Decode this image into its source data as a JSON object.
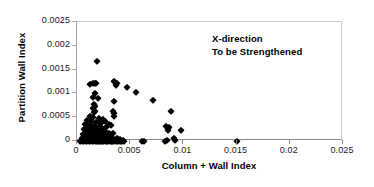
{
  "chart_data": {
    "type": "scatter",
    "title": "",
    "xlabel": "Column + Wall Index",
    "ylabel": "Partition Wall Index",
    "xlim": [
      0,
      0.025
    ],
    "ylim": [
      0,
      0.0025
    ],
    "xticks": [
      "0",
      "0.005",
      "0.01",
      "0.015",
      "0.02",
      "0.025"
    ],
    "xtick_values": [
      0,
      0.005,
      0.01,
      0.015,
      0.02,
      0.025
    ],
    "yticks": [
      "0",
      "0.0005",
      "0.001",
      "0.0015",
      "0.002",
      "0.0025"
    ],
    "ytick_values": [
      0,
      0.0005,
      0.001,
      0.0015,
      0.002,
      0.0025
    ],
    "grid": false,
    "legend": null,
    "marker": "diamond",
    "marker_color": "#000000",
    "annotations": [
      {
        "text": "X-direction",
        "x": 0.0145,
        "y": 0.00225
      },
      {
        "text": "To be Strengthened",
        "x": 0.0145,
        "y": 0.00212
      }
    ],
    "series": [
      {
        "name": "Buildings",
        "points": [
          [
            0.00185,
            0.00168
          ],
          [
            0.00125,
            0.00119
          ],
          [
            0.00155,
            0.00122
          ],
          [
            0.00168,
            0.00122
          ],
          [
            0.0018,
            0.00122
          ],
          [
            0.00345,
            0.00127
          ],
          [
            0.00358,
            0.00124
          ],
          [
            0.00368,
            0.00118
          ],
          [
            0.00375,
            0.00121
          ],
          [
            0.0047,
            0.00113
          ],
          [
            0.00555,
            0.00102
          ],
          [
            0.00168,
            0.001
          ],
          [
            0.00152,
            0.00093
          ],
          [
            0.00195,
            0.00091
          ],
          [
            0.0035,
            0.00084
          ],
          [
            0.00718,
            0.00086
          ],
          [
            0.00158,
            0.00077
          ],
          [
            0.00165,
            0.00073
          ],
          [
            0.0015,
            0.00069
          ],
          [
            0.00172,
            0.00064
          ],
          [
            0.0016,
            0.0006
          ],
          [
            0.0034,
            0.00063
          ],
          [
            0.00352,
            0.00058
          ],
          [
            0.00345,
            0.00052
          ],
          [
            0.00882,
            0.00062
          ],
          [
            0.0012,
            0.00052
          ],
          [
            0.00148,
            0.0005
          ],
          [
            0.0021,
            0.00048
          ],
          [
            0.00245,
            0.00046
          ],
          [
            0.00262,
            0.00041
          ],
          [
            0.00098,
            0.00044
          ],
          [
            0.00135,
            0.00042
          ],
          [
            0.00178,
            0.0004
          ],
          [
            0.00205,
            0.00039
          ],
          [
            0.00228,
            0.00037
          ],
          [
            0.00302,
            0.00035
          ],
          [
            0.00318,
            0.00033
          ],
          [
            0.00075,
            0.00036
          ],
          [
            0.00092,
            0.00034
          ],
          [
            0.00112,
            0.00033
          ],
          [
            0.0013,
            0.00032
          ],
          [
            0.00148,
            0.00031
          ],
          [
            0.00162,
            0.0003
          ],
          [
            0.0018,
            0.00029
          ],
          [
            0.00198,
            0.00028
          ],
          [
            0.00215,
            0.0003
          ],
          [
            0.00232,
            0.00027
          ],
          [
            0.00255,
            0.00026
          ],
          [
            0.00272,
            0.00029
          ],
          [
            0.0084,
            0.00032
          ],
          [
            0.00852,
            0.00028
          ],
          [
            0.00862,
            0.0003
          ],
          [
            0.00858,
            0.00024
          ],
          [
            0.0098,
            0.00024
          ],
          [
            0.00068,
            0.00025
          ],
          [
            0.00082,
            0.00024
          ],
          [
            0.00098,
            0.00023
          ],
          [
            0.00115,
            0.00022
          ],
          [
            0.00128,
            0.00024
          ],
          [
            0.00142,
            0.00021
          ],
          [
            0.00158,
            0.0002
          ],
          [
            0.00172,
            0.00022
          ],
          [
            0.00188,
            0.00019
          ],
          [
            0.00202,
            0.00018
          ],
          [
            0.00218,
            0.0002
          ],
          [
            0.00235,
            0.00017
          ],
          [
            0.0025,
            0.00016
          ],
          [
            0.00268,
            0.00018
          ],
          [
            0.00285,
            0.00015
          ],
          [
            0.003,
            0.00017
          ],
          [
            0.0032,
            0.00014
          ],
          [
            0.0034,
            0.00016
          ],
          [
            0.00058,
            0.00014
          ],
          [
            0.00072,
            0.00013
          ],
          [
            0.00088,
            0.00012
          ],
          [
            0.00102,
            0.00014
          ],
          [
            0.00118,
            0.00011
          ],
          [
            0.00132,
            0.00013
          ],
          [
            0.00146,
            0.0001
          ],
          [
            0.0016,
            0.00012
          ],
          [
            0.00175,
            9e-05
          ],
          [
            0.0019,
            0.00011
          ],
          [
            0.00205,
            8e-05
          ],
          [
            0.0022,
            0.0001
          ],
          [
            0.00238,
            7e-05
          ],
          [
            0.00255,
            9e-05
          ],
          [
            0.00272,
            6e-05
          ],
          [
            0.0029,
            8e-05
          ],
          [
            0.0031,
            5e-05
          ],
          [
            0.0033,
            7e-05
          ],
          [
            0.00352,
            4e-05
          ],
          [
            0.0038,
            6e-05
          ],
          [
            0.00405,
            5e-05
          ],
          [
            0.00045,
            6e-05
          ],
          [
            0.0006,
            4e-05
          ],
          [
            0.00078,
            5e-05
          ],
          [
            0.00095,
            3e-05
          ],
          [
            0.0011,
            5e-05
          ],
          [
            0.00125,
            2e-05
          ],
          [
            0.0014,
            4e-05
          ],
          [
            0.00155,
            2e-05
          ],
          [
            0.0017,
            3e-05
          ],
          [
            0.00185,
            1e-05
          ],
          [
            0.002,
            3e-05
          ],
          [
            0.00215,
            1e-05
          ],
          [
            0.00232,
            2e-05
          ],
          [
            0.00248,
            1e-05
          ],
          [
            0.00265,
            2e-05
          ],
          [
            0.00282,
            1e-05
          ],
          [
            0.003,
            2e-05
          ],
          [
            0.00318,
            1e-05
          ],
          [
            0.00336,
            1e-05
          ],
          [
            0.00355,
            2e-05
          ],
          [
            0.00372,
            1e-05
          ],
          [
            0.0039,
            3e-05
          ],
          [
            0.0041,
            1e-05
          ],
          [
            0.0043,
            2e-05
          ],
          [
            0.0003,
            1e-05
          ],
          [
            0.00042,
            0.0
          ],
          [
            0.00055,
            1e-05
          ],
          [
            0.00068,
            0.0
          ],
          [
            0.00082,
            1e-05
          ],
          [
            0.00096,
            0.0
          ],
          [
            0.0011,
            0.0
          ],
          [
            0.00124,
            1e-05
          ],
          [
            0.00138,
            0.0
          ],
          [
            0.00152,
            0.0
          ],
          [
            0.00166,
            1e-05
          ],
          [
            0.0018,
            0.0
          ],
          [
            0.00194,
            0.0
          ],
          [
            0.00208,
            1e-05
          ],
          [
            0.00222,
            0.0
          ],
          [
            0.00238,
            0.0
          ],
          [
            0.00252,
            1e-05
          ],
          [
            0.00268,
            0.0
          ],
          [
            0.00284,
            0.0
          ],
          [
            0.003,
            0.0
          ],
          [
            0.00316,
            1e-05
          ],
          [
            0.00332,
            0.0
          ],
          [
            0.00348,
            0.0
          ],
          [
            0.00364,
            0.0
          ],
          [
            0.00382,
            0.0
          ],
          [
            0.004,
            1e-05
          ],
          [
            0.0042,
            0.0
          ],
          [
            0.0044,
            0.0
          ],
          [
            0.00608,
            0.0
          ],
          [
            0.00628,
            0.0
          ],
          [
            0.0083,
            0.0
          ],
          [
            0.00845,
            2e-05
          ],
          [
            0.00908,
            7e-05
          ],
          [
            0.00918,
            3e-05
          ],
          [
            0.01505,
            0.0
          ]
        ]
      }
    ]
  }
}
